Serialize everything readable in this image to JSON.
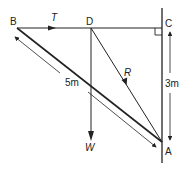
{
  "diagram": {
    "type": "statics-ladder-wall",
    "points": {
      "B": {
        "label": "B"
      },
      "D": {
        "label": "D"
      },
      "C": {
        "label": "C"
      },
      "A": {
        "label": "A"
      }
    },
    "forces": {
      "tension": {
        "label": "T"
      },
      "reaction": {
        "label": "R"
      },
      "weight": {
        "label": "W"
      }
    },
    "dimensions": {
      "ladder_length": {
        "label": "5m"
      },
      "wall_height": {
        "label": "3m"
      }
    },
    "colors": {
      "line": "#222222",
      "background": "#ffffff"
    }
  }
}
